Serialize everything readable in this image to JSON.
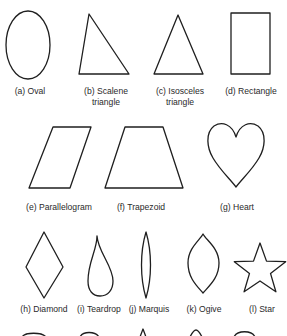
{
  "figure": {
    "shapes": [
      {
        "id": "a",
        "name": "oval",
        "label": [
          "(a) Oval"
        ]
      },
      {
        "id": "b",
        "name": "scalene-triangle",
        "label": [
          "(b) Scalene",
          "triangle"
        ]
      },
      {
        "id": "c",
        "name": "isosceles-triangle",
        "label": [
          "(c) Isosceles",
          "triangle"
        ]
      },
      {
        "id": "d",
        "name": "rectangle",
        "label": [
          "(d) Rectangle"
        ]
      },
      {
        "id": "e",
        "name": "parallelogram",
        "label": [
          "(e) Parallelogram"
        ]
      },
      {
        "id": "f",
        "name": "trapezoid",
        "label": [
          "(f) Trapezoid"
        ]
      },
      {
        "id": "g",
        "name": "heart",
        "label": [
          "(g) Heart"
        ]
      },
      {
        "id": "h",
        "name": "diamond",
        "label": [
          "(h) Diamond"
        ]
      },
      {
        "id": "i",
        "name": "teardrop",
        "label": [
          "(i) Teardrop"
        ]
      },
      {
        "id": "j",
        "name": "marquis",
        "label": [
          "(j) Marquis"
        ]
      },
      {
        "id": "k",
        "name": "ogive",
        "label": [
          "(k) Ogive"
        ]
      },
      {
        "id": "l",
        "name": "star",
        "label": [
          "(l) Star"
        ]
      }
    ],
    "partial_bottom_row_shapes": [
      "arc-shape",
      "arc-shape",
      "spike-shape",
      "tip-shape",
      "arc-shape"
    ]
  }
}
